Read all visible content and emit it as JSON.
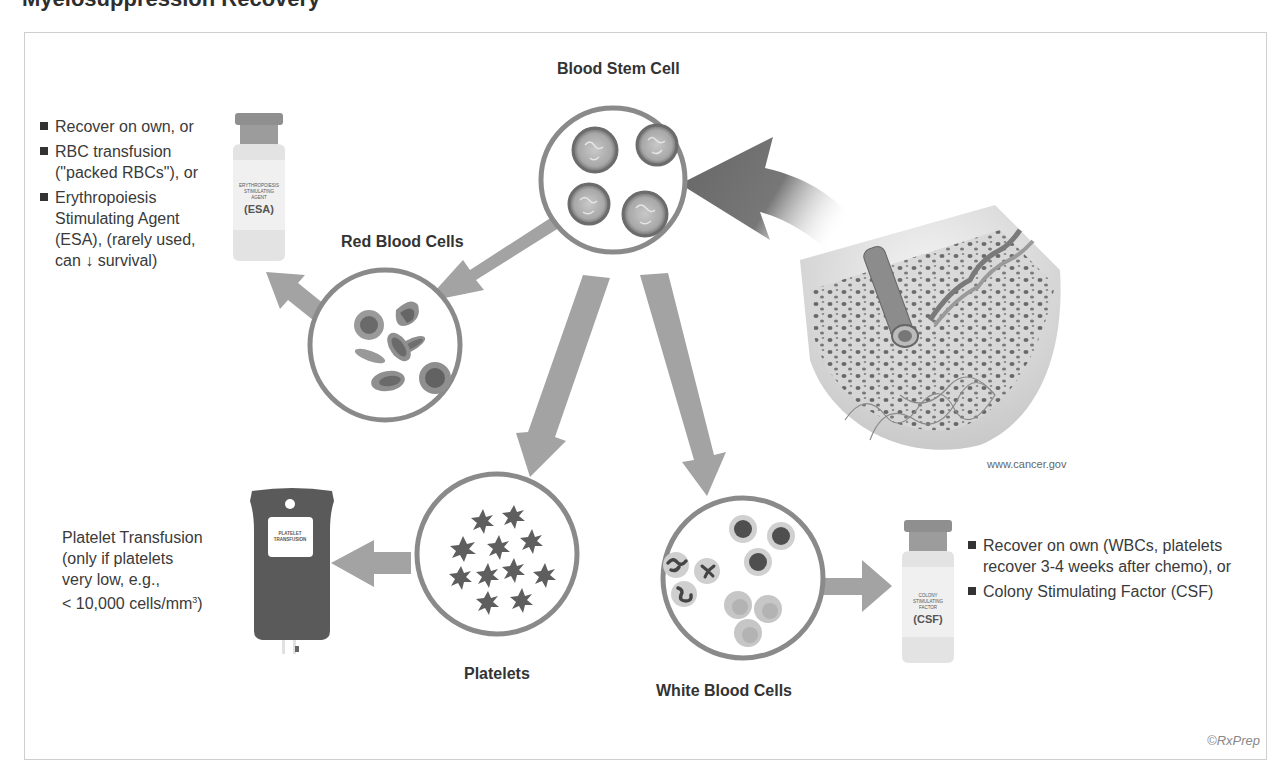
{
  "page": {
    "title": "Myelosuppression Recovery"
  },
  "diagram": {
    "nodes": {
      "stem_cell": {
        "label": "Blood Stem Cell"
      },
      "rbc": {
        "label": "Red Blood Cells"
      },
      "platelets": {
        "label": "Platelets"
      },
      "wbc": {
        "label": "White Blood Cells"
      }
    },
    "rbc_treatments": {
      "items": [
        "Recover on own, or",
        "RBC transfusion (\"packed RBCs\"), or",
        "Erythropoiesis Stimulating Agent (ESA), (rarely used, can ↓ survival)"
      ],
      "vial": {
        "small_text": "ERYTHROPOIESIS STIMULATING AGENT",
        "big_text": "(ESA)"
      }
    },
    "platelet_treatment": {
      "line1": "Platelet Transfusion",
      "line2": "(only if platelets",
      "line3": "very low, e.g.,",
      "line4": "< 10,000 cells/mm",
      "line4_sup": "3",
      "line4_end": ")",
      "bag_label": "PLATELET TRANSFUSION"
    },
    "wbc_treatments": {
      "items": [
        "Recover on own (WBCs, platelets recover 3-4 weeks after chemo), or",
        "Colony Stimulating Factor (CSF)"
      ],
      "vial": {
        "small_text": "COLONY STIMULATING FACTOR",
        "big_text": "(CSF)"
      }
    },
    "bone_image_credit": "www.cancer.gov",
    "copyright": "©RxPrep"
  },
  "colors": {
    "circle_stroke": "#8a8a8a",
    "arrow_fill": "#a3a3a3",
    "dark_arrow": "#6e6e6e",
    "cell_dark": "#6f6f6f",
    "cell_light": "#bdbdbd"
  }
}
